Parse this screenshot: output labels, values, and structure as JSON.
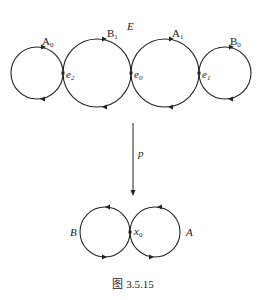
{
  "figure": {
    "caption": "图 3.5.15",
    "covering_space": {
      "label": "E",
      "loops": [
        {
          "name": "A",
          "sub": "0",
          "cx": 37,
          "cy": 73,
          "r": 26
        },
        {
          "name": "B",
          "sub": "1",
          "cx": 103,
          "cy": 73,
          "r": 34
        },
        {
          "name": "A",
          "sub": "1",
          "cx": 168,
          "cy": 73,
          "r": 34
        },
        {
          "name": "B",
          "sub": "0",
          "cx": 232,
          "cy": 73,
          "r": 26
        }
      ],
      "points": [
        {
          "name": "e",
          "sub": "2"
        },
        {
          "name": "e",
          "sub": "0"
        },
        {
          "name": "e",
          "sub": "1"
        }
      ]
    },
    "map": {
      "label": "p"
    },
    "base_space": {
      "loops": [
        {
          "name": "B"
        },
        {
          "name": "A"
        }
      ],
      "basepoint": {
        "name": "x",
        "sub": "0"
      }
    }
  }
}
